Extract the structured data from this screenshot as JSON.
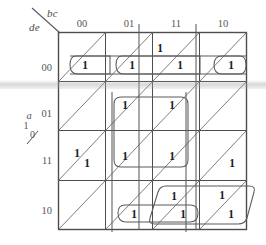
{
  "diagram": {
    "corner": {
      "top_label": "bc",
      "bottom_label": "de"
    },
    "left_axis": {
      "variable": "a",
      "upper_value": "1",
      "lower_value": "0"
    },
    "column_headers": [
      "00",
      "01",
      "11",
      "10"
    ],
    "row_headers": [
      "00",
      "01",
      "11",
      "10"
    ],
    "ones": [
      {
        "id": "r0c2u",
        "label": "1",
        "row": "00",
        "col": "11",
        "half": "upper",
        "x": 160,
        "y": 48
      },
      {
        "id": "r0c0l",
        "label": "1",
        "row": "00",
        "col": "00",
        "half": "lower",
        "x": 85,
        "y": 65
      },
      {
        "id": "r0c1l",
        "label": "1",
        "row": "00",
        "col": "01",
        "half": "lower",
        "x": 132,
        "y": 65
      },
      {
        "id": "r0c2l",
        "label": "1",
        "row": "00",
        "col": "11",
        "half": "lower",
        "x": 180,
        "y": 65
      },
      {
        "id": "r0c3l",
        "label": "1",
        "row": "00",
        "col": "10",
        "half": "lower",
        "x": 231,
        "y": 65
      },
      {
        "id": "r1c1u",
        "label": "1",
        "row": "01",
        "col": "01",
        "half": "upper",
        "x": 125,
        "y": 105
      },
      {
        "id": "r1c2u",
        "label": "1",
        "row": "01",
        "col": "11",
        "half": "upper",
        "x": 172,
        "y": 105
      },
      {
        "id": "r2c0u",
        "label": "1",
        "row": "11",
        "col": "00",
        "half": "upper",
        "x": 77,
        "y": 153
      },
      {
        "id": "r2c0l",
        "label": "1",
        "row": "11",
        "col": "00",
        "half": "lower",
        "x": 87,
        "y": 163
      },
      {
        "id": "r2c1u",
        "label": "1",
        "row": "11",
        "col": "01",
        "half": "upper",
        "x": 125,
        "y": 156
      },
      {
        "id": "r2c2u",
        "label": "1",
        "row": "11",
        "col": "11",
        "half": "upper",
        "x": 172,
        "y": 156
      },
      {
        "id": "r2c3l",
        "label": "1",
        "row": "11",
        "col": "10",
        "half": "lower",
        "x": 232,
        "y": 163
      },
      {
        "id": "r3c2u",
        "label": "1",
        "row": "10",
        "col": "11",
        "half": "upper",
        "x": 174,
        "y": 196
      },
      {
        "id": "r3c3u",
        "label": "1",
        "row": "10",
        "col": "10",
        "half": "upper",
        "x": 222,
        "y": 195
      },
      {
        "id": "r3c1l",
        "label": "1",
        "row": "10",
        "col": "01",
        "half": "lower",
        "x": 134,
        "y": 214
      },
      {
        "id": "r3c2l",
        "label": "1",
        "row": "10",
        "col": "11",
        "half": "lower",
        "x": 183,
        "y": 214
      },
      {
        "id": "r3c3l",
        "label": "1",
        "row": "10",
        "col": "10",
        "half": "lower",
        "x": 231,
        "y": 214
      }
    ],
    "colors": {
      "grid_line": "#4d4d4d",
      "diagonal_line": "#6e6e6e",
      "group_loop": "#5a5a5a",
      "text": "#3a3a3a",
      "digit": "#1d1d1d",
      "scan_artifact": "#a8a8a8",
      "background": "#ffffff"
    }
  }
}
